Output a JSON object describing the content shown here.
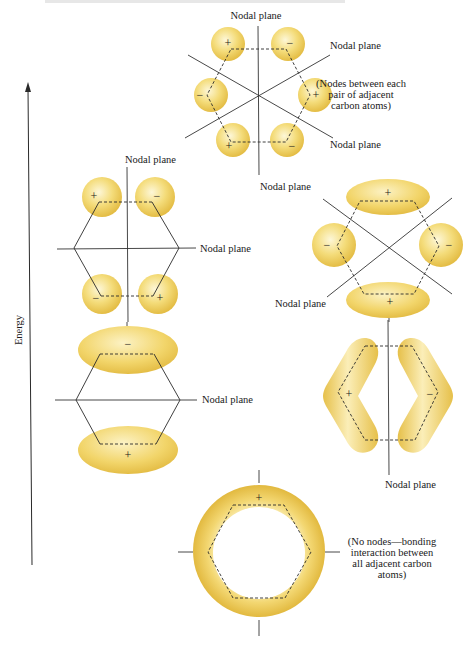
{
  "header": {
    "cropped_caption": "Figure showing π molecular orbitals of benzene"
  },
  "axis": {
    "label": "Energy",
    "direction": "up"
  },
  "labels": {
    "nodal_plane": "Nodal plane"
  },
  "orbitals": [
    {
      "id": "psi6",
      "name": "top-antibonding-orbital",
      "signs": [
        "+",
        "−",
        "−",
        "+",
        "+",
        "−"
      ],
      "nodal_planes": 3,
      "note_lines": [
        "(Nodes between each",
        "pair of adjacent",
        "carbon atoms)"
      ]
    },
    {
      "id": "psi4",
      "name": "antibonding-orbital-left",
      "signs": [
        "+",
        "−",
        "−",
        "+"
      ],
      "nodal_planes": 2
    },
    {
      "id": "psi5",
      "name": "antibonding-orbital-right",
      "signs": [
        "+",
        "−",
        "−",
        "+"
      ],
      "nodal_planes": 2
    },
    {
      "id": "psi2",
      "name": "bonding-orbital-left",
      "signs": [
        "−",
        "+"
      ],
      "nodal_planes": 1
    },
    {
      "id": "psi3",
      "name": "bonding-orbital-right",
      "signs": [
        "+",
        "−"
      ],
      "nodal_planes": 1
    },
    {
      "id": "psi1",
      "name": "lowest-bonding-orbital",
      "signs": [
        "+"
      ],
      "nodal_planes": 0,
      "note_lines": [
        "(No nodes—bonding",
        "interaction between",
        "all adjacent carbon",
        "atoms)"
      ]
    }
  ],
  "colors": {
    "lobe_fill": "#f2d66b",
    "lobe_highlight": "#fdf6d2",
    "lobe_edge": "#e2b93a",
    "line": "#2a2a2a"
  }
}
